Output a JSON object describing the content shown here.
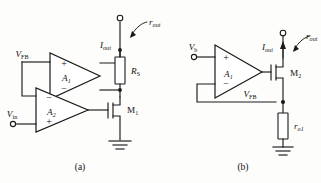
{
  "figure": {
    "background_color": "#fdfdfc",
    "line_color": "#1a1a1a",
    "width": 321,
    "height": 183
  },
  "circuit_a": {
    "caption": "(a)",
    "amp1": {
      "name": "A",
      "subscript": "1",
      "plus": "+",
      "minus": "−"
    },
    "amp2": {
      "name": "A",
      "subscript": "2",
      "plus": "+",
      "minus": "−"
    },
    "labels": {
      "v_fb": "V",
      "v_fb_sub": "FB",
      "v_in": "V",
      "v_in_sub": "in",
      "i_out": "I",
      "i_out_sub": "out",
      "r_out": "r",
      "r_out_sub": "out",
      "r_s": "R",
      "r_s_sub": "S",
      "m1": "M",
      "m1_sub": "1"
    }
  },
  "circuit_b": {
    "caption": "(b)",
    "amp1": {
      "name": "A",
      "subscript": "1",
      "plus": "+",
      "minus": "−"
    },
    "labels": {
      "v_b": "V",
      "v_b_sub": "b",
      "v_fb": "V",
      "v_fb_sub": "FB",
      "i_out": "I",
      "i_out_sub": "out",
      "r_out": "r",
      "r_out_sub": "out",
      "r_o1": "r",
      "r_o1_sub": "o1",
      "m2": "M",
      "m2_sub": "2"
    }
  }
}
